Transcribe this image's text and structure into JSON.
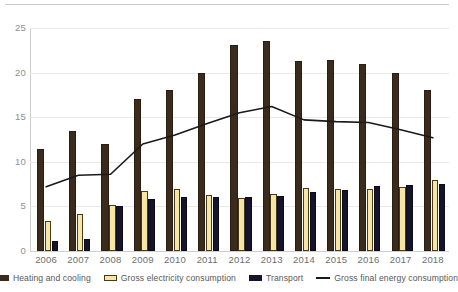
{
  "chart_data": {
    "type": "bar",
    "title": "",
    "subtitle": "",
    "xlabel": "",
    "ylabel": "",
    "ylim": [
      0,
      25
    ],
    "yticks": [
      0,
      5,
      10,
      15,
      20,
      25
    ],
    "grid": true,
    "legend_position": "bottom",
    "categories": [
      "2006",
      "2007",
      "2008",
      "2009",
      "2010",
      "2011",
      "2012",
      "2013",
      "2014",
      "2015",
      "2016",
      "2017",
      "2018"
    ],
    "series": [
      {
        "name": "Heating and cooling",
        "type": "bar",
        "color": "#3b2b1d",
        "values": [
          11.4,
          13.4,
          12.0,
          17.0,
          18.0,
          20.0,
          23.1,
          23.6,
          21.3,
          21.4,
          21.0,
          20.0,
          18.0
        ]
      },
      {
        "name": "Gross electricity consumption",
        "type": "bar",
        "color": "#f6e5a4",
        "values": [
          3.4,
          4.1,
          5.2,
          6.7,
          6.9,
          6.3,
          5.9,
          6.4,
          7.1,
          7.0,
          6.9,
          7.2,
          8.0
        ]
      },
      {
        "name": "Transport",
        "type": "bar",
        "color": "#15142c",
        "values": [
          1.1,
          1.4,
          5.0,
          5.8,
          6.0,
          6.1,
          6.0,
          6.2,
          6.6,
          6.8,
          7.3,
          7.4,
          7.5
        ]
      },
      {
        "name": "Gross final energy consumption",
        "type": "line",
        "color": "#1a1a1a",
        "values": [
          7.2,
          8.5,
          8.6,
          12.0,
          13.0,
          14.3,
          15.5,
          16.2,
          14.7,
          14.5,
          14.4,
          13.6,
          12.7
        ]
      }
    ]
  },
  "axis": {
    "ytick_labels": [
      "25",
      "20",
      "15",
      "10",
      "5",
      "0"
    ]
  },
  "legend": {
    "items": [
      {
        "label": "Heating and cooling",
        "kind": "brown"
      },
      {
        "label": "Gross electricity consumption",
        "kind": "yellow"
      },
      {
        "label": "Transport",
        "kind": "navy"
      },
      {
        "label": "Gross final energy consumption",
        "kind": "line"
      }
    ]
  }
}
